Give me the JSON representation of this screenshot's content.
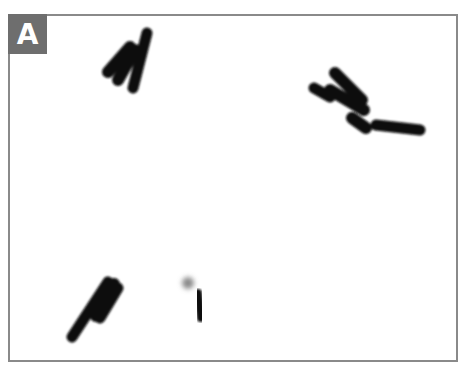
{
  "panel": {
    "label": "A",
    "label_bg": "#6e6e6e",
    "border_color": "#8a8a8a"
  },
  "image": {
    "subject": "micrograph of rod-shaped cells",
    "clusters": [
      {
        "name": "top-left-cluster",
        "cells": 3
      },
      {
        "name": "top-right-cluster",
        "cells": 4
      },
      {
        "name": "bottom-left-cluster",
        "cells": 3
      },
      {
        "name": "bottom-center-cell",
        "cells": 1,
        "note": "faint gray blob at tip"
      }
    ]
  }
}
